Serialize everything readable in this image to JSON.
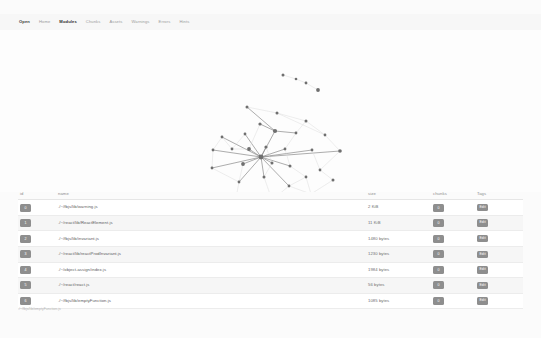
{
  "app": {
    "title": "webpack-analyse - Modules"
  },
  "nav": {
    "items": [
      {
        "label": "Open",
        "state": "brand"
      },
      {
        "label": "Home",
        "state": "normal"
      },
      {
        "label": "Modules",
        "state": "active"
      },
      {
        "label": "Chunks",
        "state": "normal"
      },
      {
        "label": "Assets",
        "state": "normal"
      },
      {
        "label": "Warnings",
        "state": "normal"
      },
      {
        "label": "Errors",
        "state": "normal"
      },
      {
        "label": "Hints",
        "state": "normal"
      }
    ]
  },
  "graph": {
    "name": "module-dependency-graph",
    "node_color": "#6f6f6f",
    "edge_color": "#d8d8d8",
    "highlight_edge_color": "#8a8a8a",
    "node_count": 34,
    "nodes": [
      {
        "id": "n0",
        "x": 283,
        "y": 45,
        "r": 1.5
      },
      {
        "id": "n1",
        "x": 296,
        "y": 49,
        "r": 1.3
      },
      {
        "id": "n2",
        "x": 306,
        "y": 53,
        "r": 1.4
      },
      {
        "id": "n3",
        "x": 318,
        "y": 60,
        "r": 1.9
      },
      {
        "id": "n4",
        "x": 247,
        "y": 77,
        "r": 1.5
      },
      {
        "id": "n5",
        "x": 277,
        "y": 83,
        "r": 1.5
      },
      {
        "id": "n6",
        "x": 306,
        "y": 91,
        "r": 1.5
      },
      {
        "id": "n7",
        "x": 260,
        "y": 94,
        "r": 1.6
      },
      {
        "id": "n8",
        "x": 275,
        "y": 101,
        "r": 2.1
      },
      {
        "id": "n9",
        "x": 296,
        "y": 103,
        "r": 1.4
      },
      {
        "id": "n10",
        "x": 245,
        "y": 104,
        "r": 1.4
      },
      {
        "id": "n11",
        "x": 222,
        "y": 107,
        "r": 1.4
      },
      {
        "id": "n12",
        "x": 325,
        "y": 105,
        "r": 1.4
      },
      {
        "id": "n13",
        "x": 213,
        "y": 120,
        "r": 1.4
      },
      {
        "id": "n14",
        "x": 232,
        "y": 119,
        "r": 1.4
      },
      {
        "id": "n15",
        "x": 249,
        "y": 119,
        "r": 1.9
      },
      {
        "id": "n16",
        "x": 266,
        "y": 117,
        "r": 1.6
      },
      {
        "id": "n17",
        "x": 285,
        "y": 119,
        "r": 1.4
      },
      {
        "id": "n18",
        "x": 312,
        "y": 120,
        "r": 1.4
      },
      {
        "id": "n19",
        "x": 340,
        "y": 121,
        "r": 1.8
      },
      {
        "id": "n20",
        "x": 261,
        "y": 127,
        "r": 2.4
      },
      {
        "id": "n21",
        "x": 243,
        "y": 134,
        "r": 1.9
      },
      {
        "id": "n22",
        "x": 272,
        "y": 133,
        "r": 1.5
      },
      {
        "id": "n23",
        "x": 290,
        "y": 136,
        "r": 1.5
      },
      {
        "id": "n24",
        "x": 212,
        "y": 138,
        "r": 1.4
      },
      {
        "id": "n25",
        "x": 320,
        "y": 140,
        "r": 1.4
      },
      {
        "id": "n26",
        "x": 306,
        "y": 147,
        "r": 1.4
      },
      {
        "id": "n27",
        "x": 333,
        "y": 150,
        "r": 1.5
      },
      {
        "id": "n28",
        "x": 264,
        "y": 147,
        "r": 1.5
      },
      {
        "id": "n29",
        "x": 239,
        "y": 152,
        "r": 1.4
      },
      {
        "id": "n30",
        "x": 289,
        "y": 156,
        "r": 1.4
      },
      {
        "id": "n31",
        "x": 311,
        "y": 164,
        "r": 1.5
      },
      {
        "id": "n32",
        "x": 272,
        "y": 170,
        "r": 1.5
      },
      {
        "id": "n33",
        "x": 236,
        "y": 168,
        "r": 1.4
      },
      {
        "id": "n34",
        "x": 214,
        "y": 182,
        "r": 1.6
      },
      {
        "id": "n35",
        "x": 206,
        "y": 186,
        "r": 1.4
      },
      {
        "id": "n36",
        "x": 291,
        "y": 186,
        "r": 1.4
      }
    ],
    "edges": [
      [
        "n0",
        "n1"
      ],
      [
        "n1",
        "n2"
      ],
      [
        "n2",
        "n3"
      ],
      [
        "n4",
        "n5"
      ],
      [
        "n5",
        "n12"
      ],
      [
        "n4",
        "n8"
      ],
      [
        "n8",
        "n20"
      ],
      [
        "n8",
        "n7"
      ],
      [
        "n8",
        "n9"
      ],
      [
        "n20",
        "n11"
      ],
      [
        "n20",
        "n13"
      ],
      [
        "n20",
        "n15"
      ],
      [
        "n20",
        "n16"
      ],
      [
        "n20",
        "n17"
      ],
      [
        "n20",
        "n18"
      ],
      [
        "n20",
        "n19"
      ],
      [
        "n20",
        "n21"
      ],
      [
        "n20",
        "n22"
      ],
      [
        "n20",
        "n23"
      ],
      [
        "n20",
        "n28"
      ],
      [
        "n20",
        "n10"
      ],
      [
        "n20",
        "n24"
      ],
      [
        "n20",
        "n29"
      ],
      [
        "n20",
        "n30"
      ],
      [
        "n11",
        "n13"
      ],
      [
        "n13",
        "n24"
      ],
      [
        "n24",
        "n29"
      ],
      [
        "n29",
        "n33"
      ],
      [
        "n33",
        "n32"
      ],
      [
        "n32",
        "n30"
      ],
      [
        "n30",
        "n31"
      ],
      [
        "n31",
        "n27"
      ],
      [
        "n27",
        "n25"
      ],
      [
        "n25",
        "n19"
      ],
      [
        "n19",
        "n12"
      ],
      [
        "n12",
        "n6"
      ],
      [
        "n6",
        "n9"
      ],
      [
        "n9",
        "n17"
      ],
      [
        "n17",
        "n23"
      ],
      [
        "n23",
        "n26"
      ],
      [
        "n26",
        "n31"
      ],
      [
        "n22",
        "n28"
      ],
      [
        "n28",
        "n32"
      ],
      [
        "n21",
        "n29"
      ],
      [
        "n15",
        "n14"
      ],
      [
        "n14",
        "n11"
      ],
      [
        "n16",
        "n22"
      ],
      [
        "n18",
        "n25"
      ],
      [
        "n34",
        "n35"
      ],
      [
        "n33",
        "n34"
      ],
      [
        "n7",
        "n15"
      ],
      [
        "n10",
        "n14"
      ],
      [
        "n5",
        "n6"
      ],
      [
        "n26",
        "n30"
      ]
    ]
  },
  "table": {
    "columns": [
      {
        "key": "id",
        "label": "id"
      },
      {
        "key": "name",
        "label": "name"
      },
      {
        "key": "size",
        "label": "size"
      },
      {
        "key": "chunks",
        "label": "chunks"
      },
      {
        "key": "tags",
        "label": "Tags"
      }
    ],
    "tag_button_label": "Edit",
    "rows": [
      {
        "id": "0",
        "name": "./~/fbjs/lib/warning.js",
        "size": "2 KiB",
        "chunks": "0"
      },
      {
        "id": "1",
        "name": "./~/react/lib/ReactElement.js",
        "size": "11 KiB",
        "chunks": "0"
      },
      {
        "id": "2",
        "name": "./~/fbjs/lib/invariant.js",
        "size": "1480 bytes",
        "chunks": "0"
      },
      {
        "id": "3",
        "name": "./~/react/lib/reactProdInvariant.js",
        "size": "1230 bytes",
        "chunks": "0"
      },
      {
        "id": "4",
        "name": "./~/object-assign/index.js",
        "size": "1984 bytes",
        "chunks": "0"
      },
      {
        "id": "5",
        "name": "./~/react/react.js",
        "size": "56 bytes",
        "chunks": "0"
      },
      {
        "id": "6",
        "name": "./~/fbjs/lib/emptyFunction.js",
        "size": "1085 bytes",
        "chunks": "0"
      }
    ]
  },
  "status": {
    "text": "./~/fbjs/lib/emptyFunction.js"
  },
  "caption": {
    "text": ""
  }
}
